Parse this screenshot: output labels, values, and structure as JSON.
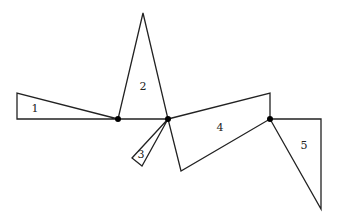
{
  "diagram": {
    "type": "polygon-dissection",
    "stroke_color": "#222222",
    "dot_color": "#000000",
    "background": "#ffffff",
    "baseline": {
      "from": [
        17,
        119
      ],
      "to": [
        321,
        119
      ]
    },
    "dots": [
      {
        "id": "pivot-a",
        "x": 118,
        "y": 119
      },
      {
        "id": "pivot-b",
        "x": 168,
        "y": 119
      },
      {
        "id": "pivot-c",
        "x": 270,
        "y": 119
      }
    ],
    "pieces": [
      {
        "label": "1",
        "points": [
          [
            17,
            93
          ],
          [
            17,
            119
          ],
          [
            118,
            119
          ]
        ],
        "label_pos": [
          35,
          112
        ]
      },
      {
        "label": "2",
        "points": [
          [
            143,
            13
          ],
          [
            118,
            119
          ],
          [
            168,
            119
          ]
        ],
        "label_pos": [
          143,
          90
        ]
      },
      {
        "label": "3",
        "points": [
          [
            168,
            119
          ],
          [
            132,
            158
          ],
          [
            142,
            166
          ]
        ],
        "label_pos": [
          141,
          158
        ]
      },
      {
        "label": "4",
        "points": [
          [
            168,
            119
          ],
          [
            270,
            93
          ],
          [
            270,
            119
          ],
          [
            181,
            171
          ]
        ],
        "label_pos": [
          220,
          131
        ]
      },
      {
        "label": "5",
        "points": [
          [
            270,
            119
          ],
          [
            321,
            119
          ],
          [
            321,
            209
          ]
        ],
        "label_pos": [
          304,
          149
        ]
      }
    ]
  }
}
